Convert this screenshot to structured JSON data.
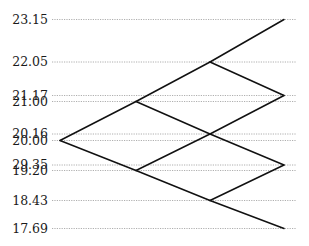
{
  "chart_data": {
    "type": "line",
    "subtype": "binomial-tree",
    "title": "",
    "xlabel": "",
    "ylabel": "",
    "grid": "horizontal dotted lines at each node value",
    "legend": null,
    "steps": 3,
    "y_tick_labels": [
      "23.15",
      "22.05",
      "21.17",
      "21.00",
      "20.16",
      "20.00",
      "29.35",
      "19.20",
      "18.43",
      "17.69"
    ],
    "nodes": [
      {
        "id": "n0",
        "step": 0,
        "value": 20.0
      },
      {
        "id": "n1u",
        "step": 1,
        "value": 21.0
      },
      {
        "id": "n1d",
        "step": 1,
        "value": 19.2
      },
      {
        "id": "n2uu",
        "step": 2,
        "value": 22.05
      },
      {
        "id": "n2ud",
        "step": 2,
        "value": 20.16
      },
      {
        "id": "n2dd",
        "step": 2,
        "value": 18.43
      },
      {
        "id": "n3uuu",
        "step": 3,
        "value": 23.15
      },
      {
        "id": "n3uud",
        "step": 3,
        "value": 21.17
      },
      {
        "id": "n3udd",
        "step": 3,
        "value": 19.35
      },
      {
        "id": "n3ddd",
        "step": 3,
        "value": 17.69
      }
    ],
    "edges": [
      [
        "n0",
        "n1u"
      ],
      [
        "n0",
        "n1d"
      ],
      [
        "n1u",
        "n2uu"
      ],
      [
        "n1u",
        "n2ud"
      ],
      [
        "n1d",
        "n2ud"
      ],
      [
        "n1d",
        "n2dd"
      ],
      [
        "n2uu",
        "n3uuu"
      ],
      [
        "n2uu",
        "n3uud"
      ],
      [
        "n2ud",
        "n3uud"
      ],
      [
        "n2ud",
        "n3udd"
      ],
      [
        "n2dd",
        "n3udd"
      ],
      [
        "n2dd",
        "n3ddd"
      ]
    ],
    "annotations": [
      "Label '29.35' shown on axis for the 19.35 node level (as rendered)"
    ]
  },
  "layout": {
    "step_x": [
      60,
      136,
      210,
      284
    ],
    "gridline_x_start": 52,
    "gridline_x_end": 296,
    "label_x": 48,
    "levels": [
      {
        "label": "23.15",
        "y": 19.5
      },
      {
        "label": "22.05",
        "y": 62
      },
      {
        "label": "21.17",
        "y": 95.5
      },
      {
        "label": "21.00",
        "y": 101.5
      },
      {
        "label": "20.16",
        "y": 134
      },
      {
        "label": "20.00",
        "y": 140.5
      },
      {
        "label": "29.35",
        "y": 165
      },
      {
        "label": "19.20",
        "y": 170.5
      },
      {
        "label": "18.43",
        "y": 200.5
      },
      {
        "label": "17.69",
        "y": 228.5
      }
    ],
    "node_positions": {
      "n0": [
        60,
        140.5
      ],
      "n1u": [
        136,
        101.5
      ],
      "n1d": [
        136,
        170.5
      ],
      "n2uu": [
        210,
        62
      ],
      "n2ud": [
        210,
        134
      ],
      "n2dd": [
        210,
        200.5
      ],
      "n3uuu": [
        284,
        19.5
      ],
      "n3uud": [
        284,
        95.5
      ],
      "n3udd": [
        284,
        165
      ],
      "n3ddd": [
        284,
        228.5
      ]
    }
  }
}
